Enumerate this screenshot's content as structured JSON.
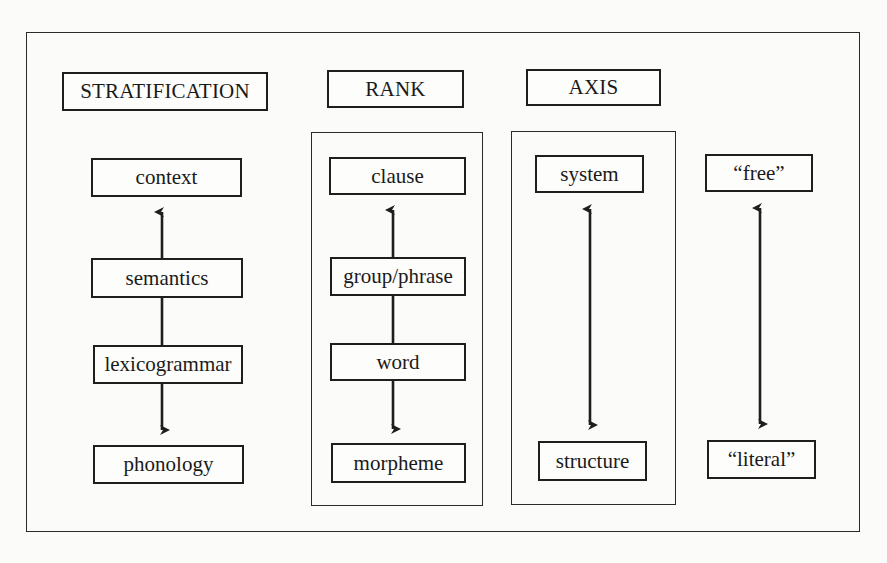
{
  "diagram": {
    "headings": {
      "stratification": "STRATIFICATION",
      "rank": "RANK",
      "axis": "AXIS"
    },
    "columns": {
      "stratification": {
        "nodes": [
          "context",
          "semantics",
          "lexicogrammar",
          "phonology"
        ],
        "arrows": [
          {
            "from": "semantics",
            "to": "context",
            "type": "up-arrow"
          },
          {
            "from": "semantics",
            "to": "lexicogrammar",
            "type": "line"
          },
          {
            "from": "lexicogrammar",
            "to": "phonology",
            "type": "down-arrow"
          }
        ]
      },
      "rank": {
        "nodes": [
          "clause",
          "group/phrase",
          "word",
          "morpheme"
        ],
        "arrows": [
          {
            "from": "group/phrase",
            "to": "clause",
            "type": "up-arrow"
          },
          {
            "from": "group/phrase",
            "to": "word",
            "type": "line"
          },
          {
            "from": "word",
            "to": "morpheme",
            "type": "down-arrow"
          }
        ]
      },
      "axis": {
        "nodes": [
          "system",
          "structure"
        ],
        "arrows": [
          {
            "from": "system",
            "to": "structure",
            "type": "double-arrow"
          }
        ]
      },
      "translation": {
        "nodes": [
          "“free”",
          "“literal”"
        ],
        "arrows": [
          {
            "from": "“free”",
            "to": "“literal”",
            "type": "double-arrow"
          }
        ]
      }
    },
    "colors": {
      "line": "#1e1e1e",
      "background": "#fbfbfa"
    }
  }
}
